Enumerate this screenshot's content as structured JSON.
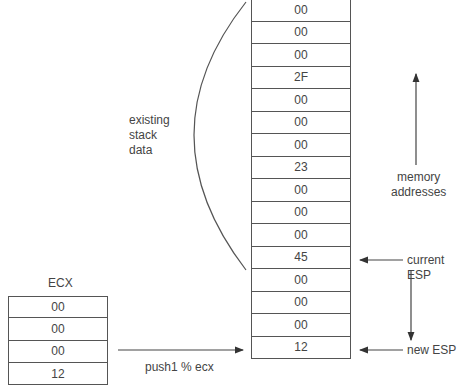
{
  "stack": {
    "cells": [
      "00",
      "00",
      "00",
      "2F",
      "00",
      "00",
      "00",
      "23",
      "00",
      "00",
      "00",
      "45",
      "00",
      "00",
      "00",
      "12"
    ]
  },
  "ecx": {
    "title": "ECX",
    "cells": [
      "00",
      "00",
      "00",
      "12"
    ]
  },
  "labels": {
    "existing_line1": "existing",
    "existing_line2": "stack",
    "existing_line3": "data",
    "memory_line1": "memory",
    "memory_line2": "addresses",
    "current_esp": "current ESP",
    "new_esp": "new ESP",
    "instruction": "push1 % ecx"
  }
}
